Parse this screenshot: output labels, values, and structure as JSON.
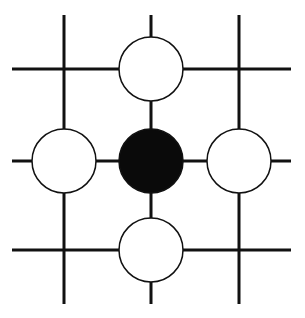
{
  "diagram": {
    "type": "go-board-fragment",
    "colors": {
      "background": "#ffffff",
      "line": "#111111",
      "black_stone": "#0a0a0a",
      "white_stone": "#ffffff",
      "stone_outline": "#111111"
    },
    "grid": {
      "columns_x": [
        64,
        151,
        239
      ],
      "rows_y": [
        69,
        161,
        250
      ],
      "h_extent": [
        12,
        291
      ],
      "v_extent": [
        15,
        304
      ],
      "line_width": 3
    },
    "stone_radius": 32,
    "stones": [
      {
        "color": "white",
        "col": 1,
        "row": 0
      },
      {
        "color": "white",
        "col": 0,
        "row": 1
      },
      {
        "color": "black",
        "col": 1,
        "row": 1
      },
      {
        "color": "white",
        "col": 2,
        "row": 1
      },
      {
        "color": "white",
        "col": 1,
        "row": 2
      }
    ]
  }
}
